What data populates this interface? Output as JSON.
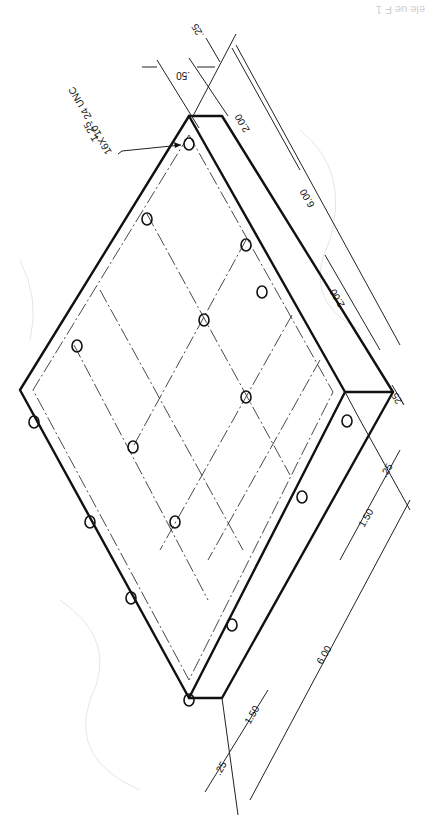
{
  "drawing": {
    "type": "isometric technical drawing (rotated 180°)",
    "subject": "rectangular plate with 4x4 tapped hole pattern",
    "corner_fragment": "ele ue F 1",
    "callout": {
      "line1": "16X 10 - 24 UNC",
      "line2": "↧.25"
    },
    "dimensions": {
      "top_edge_offset": ".25",
      "top_hole_offset": ".50",
      "right_hole_spacing_a": "2.00",
      "right_hole_spacing_b": "2.00",
      "right_overall": "6.00",
      "right_corner_offset": ".25",
      "bottom_edge_offset_a": ".25",
      "bottom_hole_spacing_a": "1.50",
      "bottom_overall": "6.00",
      "bottom_edge_offset_b": ".25",
      "bottom_hole_spacing_b": "1.50"
    },
    "hole_count": 16,
    "colors": {
      "line": "#111111",
      "background": "#ffffff"
    }
  }
}
